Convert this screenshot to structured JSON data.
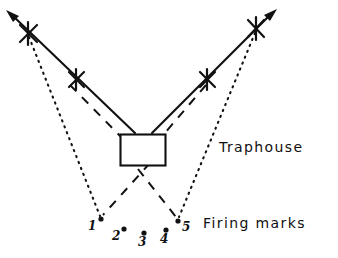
{
  "figure": {
    "kind": "trap-shooting-field-diagram",
    "background_color": "#ffffff",
    "ink_color": "#111111",
    "width": 338,
    "height": 258
  },
  "labels": {
    "traphouse": "Traphouse",
    "firing_marks": "Firing marks"
  },
  "traphouse_box": {
    "x": 120,
    "y": 134,
    "width": 45,
    "height": 31
  },
  "firing_marks": [
    {
      "id": "1",
      "label": "1",
      "dot_x": 101,
      "dot_y": 219,
      "label_x": 90,
      "label_y": 220
    },
    {
      "id": "2",
      "label": "2",
      "dot_x": 124,
      "dot_y": 229,
      "label_x": 113,
      "label_y": 230
    },
    {
      "id": "3",
      "label": "3",
      "dot_x": 144,
      "dot_y": 233,
      "label_x": 138,
      "label_y": 236
    },
    {
      "id": "4",
      "label": "4",
      "dot_x": 166,
      "dot_y": 230,
      "label_x": 160,
      "label_y": 233
    },
    {
      "id": "5",
      "label": "5",
      "dot_x": 178,
      "dot_y": 221,
      "label_x": 182,
      "label_y": 222
    }
  ],
  "x_marks": [
    {
      "id": "left-outer",
      "x": 28,
      "y": 33
    },
    {
      "id": "left-inner",
      "x": 76,
      "y": 79
    },
    {
      "id": "right-inner",
      "x": 207,
      "y": 79
    },
    {
      "id": "right-outer",
      "x": 256,
      "y": 28
    }
  ],
  "solid_arrows": [
    {
      "id": "left-boundary",
      "x1": 135,
      "y1": 133,
      "x2": 7,
      "y2": 11,
      "style": "solid",
      "arrowhead": "end"
    },
    {
      "id": "right-boundary",
      "x1": 152,
      "y1": 133,
      "x2": 276,
      "y2": 10,
      "style": "solid",
      "arrowhead": "end"
    }
  ],
  "dashed_lines": [
    {
      "id": "dash-left-upper",
      "x1": 72,
      "y1": 84,
      "x2": 124,
      "y2": 139
    },
    {
      "id": "dash-right-upper",
      "x1": 204,
      "y1": 84,
      "x2": 160,
      "y2": 139
    },
    {
      "id": "dash-left-lower",
      "x1": 148,
      "y1": 165,
      "x2": 104,
      "y2": 215
    },
    {
      "id": "dash-right-lower",
      "x1": 140,
      "y1": 168,
      "x2": 175,
      "y2": 217
    }
  ],
  "dotted_lines": [
    {
      "id": "dot-left",
      "x1": 29,
      "y1": 37,
      "x2": 100,
      "y2": 216
    },
    {
      "id": "dot-right",
      "x1": 255,
      "y1": 33,
      "x2": 179,
      "y2": 217
    }
  ]
}
